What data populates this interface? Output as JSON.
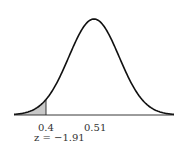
{
  "chart_data": {
    "type": "area",
    "title": "",
    "xlabel": "",
    "ylabel": "",
    "mean": 0.51,
    "tick_labels": [
      "0.4",
      "0.51"
    ],
    "ticks": [
      0.4,
      0.51
    ],
    "shaded_region": {
      "from": "left tail",
      "to": 0.4
    },
    "annotations": [
      "z = −1.91"
    ],
    "z_score": -1.91,
    "grid": false,
    "legend": null
  },
  "labels": {
    "tick_left": "0.4",
    "tick_mean": "0.51",
    "z_label": "z = −1.91"
  },
  "colors": {
    "curve": "#111111",
    "shade": "#c8c8c8",
    "axis": "#222222"
  }
}
